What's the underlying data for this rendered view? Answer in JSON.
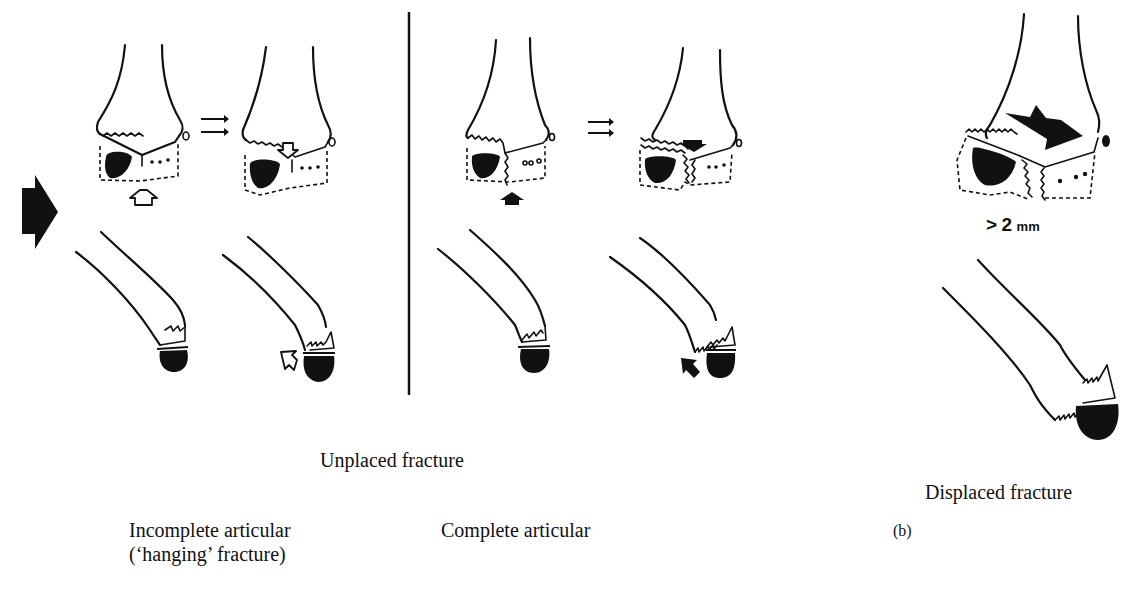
{
  "figure": {
    "panel_label": "(b)",
    "sections": {
      "unplaced": {
        "title": "Unplaced fracture",
        "subtypes": [
          {
            "label_line1": "Incomplete articular",
            "label_line2": "(‘hanging’ fracture)"
          },
          {
            "label_line1": "Complete articular",
            "label_line2": ""
          }
        ]
      },
      "displaced": {
        "title": "Displaced fracture",
        "threshold_prefix": ">",
        "threshold_value": "2",
        "threshold_unit": "mm"
      }
    },
    "icons": {
      "force_arrow": "big-black-arrow-right",
      "transition_arrows": "double-arrow-right",
      "hollow_arrow": "white-block-arrow",
      "solid_arrow": "black-block-arrow"
    },
    "colors": {
      "ink": "#111111",
      "paper": "#ffffff"
    }
  }
}
